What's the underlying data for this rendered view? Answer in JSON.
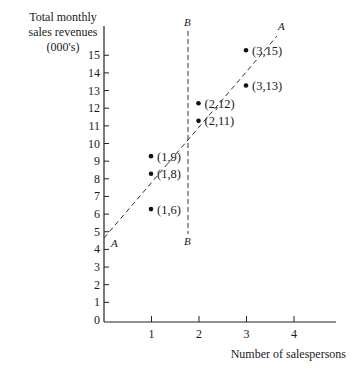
{
  "chart_data": {
    "type": "scatter",
    "title": "",
    "ylabel": [
      "Total monthly",
      "sales revenues",
      "(000's)"
    ],
    "xlabel": "Number of salespersons",
    "xlim": [
      0,
      4.8
    ],
    "ylim": [
      0,
      16.5
    ],
    "x_ticks": [
      "1",
      "2",
      "3",
      "4"
    ],
    "y_ticks": [
      "0",
      "1",
      "2",
      "3",
      "4",
      "5",
      "6",
      "7",
      "8",
      "9",
      "10",
      "11",
      "12",
      "13",
      "14",
      "15"
    ],
    "grid": false,
    "points": [
      {
        "x": 1,
        "y": 6,
        "label": "(1,6)"
      },
      {
        "x": 1,
        "y": 8,
        "label": "(1,8)"
      },
      {
        "x": 1,
        "y": 9,
        "label": "(1,9)"
      },
      {
        "x": 2,
        "y": 11,
        "label": "(2,11)"
      },
      {
        "x": 2,
        "y": 12,
        "label": "(2,12)"
      },
      {
        "x": 3,
        "y": 13,
        "label": "(3,13)"
      },
      {
        "x": 3,
        "y": 15,
        "label": "(3,15)"
      }
    ],
    "lines": [
      {
        "name": "A",
        "style": "dashed",
        "from": [
          0,
          4.7
        ],
        "to": [
          3.6,
          15.9
        ],
        "description": "fitted regression line A-A"
      },
      {
        "name": "B",
        "style": "dashed",
        "from": [
          1.75,
          4.8
        ],
        "to": [
          1.75,
          16.4
        ],
        "description": "vertical line B-B"
      }
    ],
    "annotations": [
      "A",
      "A",
      "B",
      "B"
    ]
  }
}
